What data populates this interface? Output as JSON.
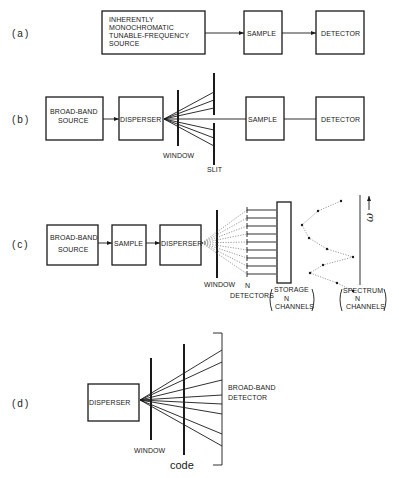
{
  "panels": {
    "a": {
      "label": "(a)",
      "source": [
        "INHERENTLY",
        "MONOCHROMATIC",
        "TUNABLE-FREQUENCY",
        "SOURCE"
      ],
      "sample": "SAMPLE",
      "detector": "DETECTOR"
    },
    "b": {
      "label": "(b)",
      "source": [
        "BROAD-BAND",
        "SOURCE"
      ],
      "disperser": "DISPERSER",
      "window": "WINDOW",
      "slit": "SLIT",
      "sample": "SAMPLE",
      "detector": "DETECTOR"
    },
    "c": {
      "label": "(c)",
      "source": [
        "BROAD-BAND",
        "SOURCE"
      ],
      "sample": "SAMPLE",
      "disperser": "DISPERSER",
      "window": "WINDOW",
      "detectors": [
        "N",
        "DETECTORS"
      ],
      "storage": [
        "STORAGE",
        "N",
        "CHANNELS"
      ],
      "spectrum": [
        "SPECTRUM",
        "N",
        "CHANNELS"
      ],
      "axis_symbol": "ω"
    },
    "d": {
      "label": "(d)",
      "disperser": "DISPERSER",
      "window": "WINDOW",
      "code": "code",
      "detector": [
        "BROAD-BAND",
        "DETECTOR"
      ]
    }
  }
}
